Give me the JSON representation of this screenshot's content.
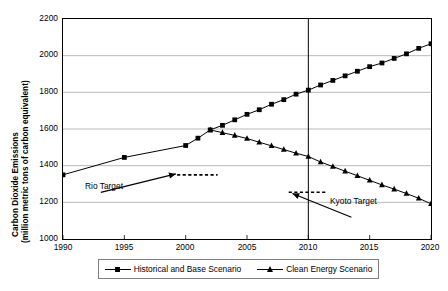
{
  "chart_data": {
    "type": "line",
    "title": "",
    "xlabel": "",
    "ylabel": "Carbon Dioxide Emissions (million metric tons of carbon equivalent)",
    "ylabel_line1": "Carbon Dioxide Emissions",
    "ylabel_line2": "(million metric tons of carbon equivalent)",
    "xlim": [
      1990,
      2020
    ],
    "ylim": [
      1000,
      2200
    ],
    "ytick_labels": [
      "2200",
      "2000",
      "1800",
      "1600",
      "1400",
      "1200",
      "1000"
    ],
    "yticks": [
      2200,
      2000,
      1800,
      1600,
      1400,
      1200,
      1000
    ],
    "xtick_labels": [
      "1990",
      "1995",
      "2000",
      "2005",
      "2010",
      "2015",
      "2020"
    ],
    "xticks": [
      1990,
      1995,
      2000,
      2005,
      2010,
      2015,
      2020
    ],
    "grid": "horizontal",
    "legend_position": "bottom",
    "series": [
      {
        "name": "Historical and Base Scenario",
        "marker": "square",
        "x": [
          1990,
          1995,
          2000,
          2001,
          2002,
          2003,
          2004,
          2005,
          2006,
          2007,
          2008,
          2009,
          2010,
          2011,
          2012,
          2013,
          2014,
          2015,
          2016,
          2017,
          2018,
          2019,
          2020
        ],
        "values": [
          1350,
          1445,
          1510,
          1550,
          1595,
          1620,
          1650,
          1680,
          1705,
          1735,
          1760,
          1790,
          1812,
          1840,
          1865,
          1890,
          1915,
          1940,
          1960,
          1985,
          2010,
          2040,
          2065
        ]
      },
      {
        "name": "Clean Energy Scenario",
        "marker": "triangle",
        "x": [
          2002,
          2003,
          2004,
          2005,
          2006,
          2007,
          2008,
          2009,
          2010,
          2011,
          2012,
          2013,
          2014,
          2015,
          2016,
          2017,
          2018,
          2019,
          2020
        ],
        "values": [
          1595,
          1580,
          1565,
          1548,
          1528,
          1508,
          1488,
          1468,
          1450,
          1420,
          1395,
          1370,
          1345,
          1320,
          1295,
          1272,
          1248,
          1222,
          1192
        ]
      }
    ],
    "reference_lines": [
      {
        "name": "rio-target",
        "label": "Rio Target",
        "style": "dashed",
        "y": 1350,
        "x_start": 1999.3,
        "x_end": 2002.6
      },
      {
        "name": "kyoto-target",
        "label": "Kyoto Target",
        "style": "dashed",
        "y": 1255,
        "x_start": 2008.4,
        "x_end": 2011.4
      }
    ],
    "vertical_lines": [
      {
        "name": "year-2010-marker",
        "x": 2010,
        "style": "solid"
      }
    ],
    "annotations": [
      {
        "name": "rio-target-annotation",
        "label": "Rio Target",
        "points_to_x": 1999.3,
        "points_to_y": 1350
      },
      {
        "name": "kyoto-target-annotation",
        "label": "Kyoto Target",
        "points_to_x": 2008.6,
        "points_to_y": 1248
      }
    ]
  },
  "legend": {
    "entries": [
      {
        "label": "Historical and Base Scenario",
        "marker": "square"
      },
      {
        "label": "Clean Energy Scenario",
        "marker": "triangle"
      }
    ]
  }
}
